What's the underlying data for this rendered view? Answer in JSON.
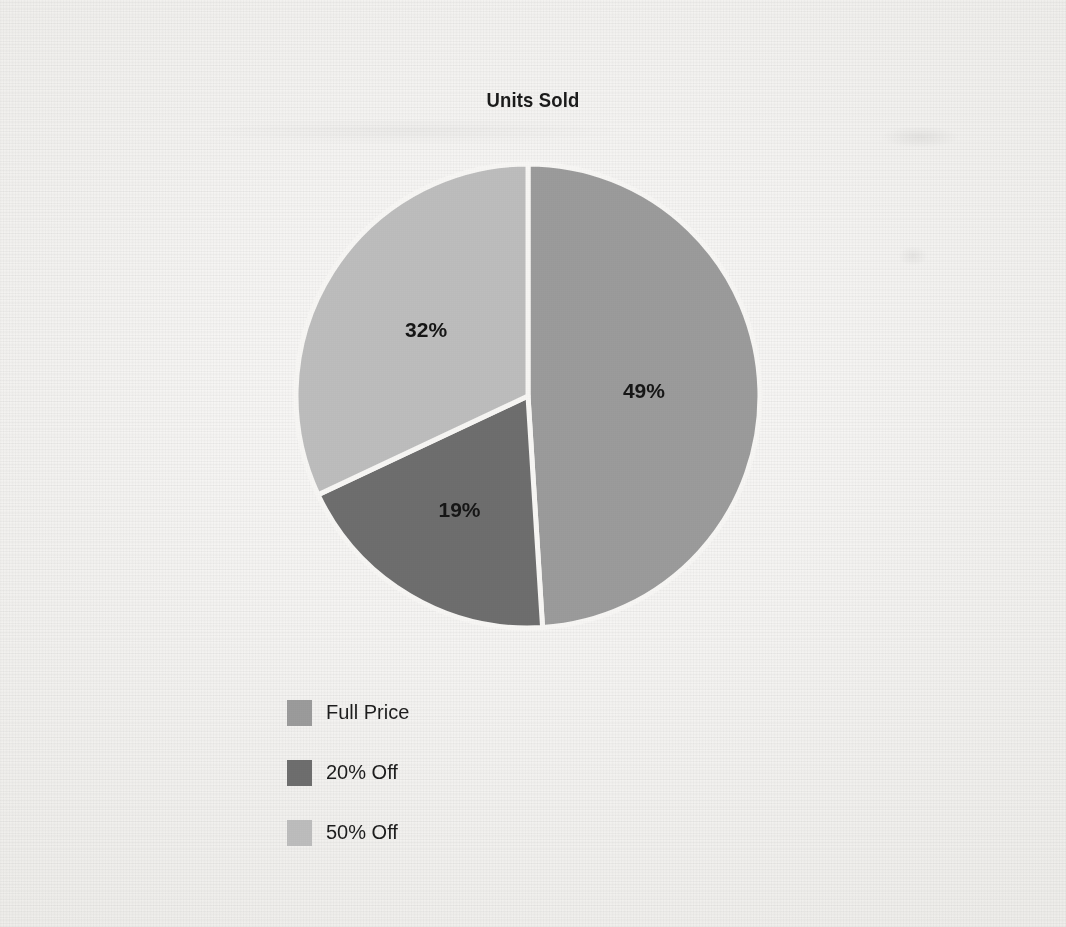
{
  "chart_data": {
    "type": "pie",
    "title": "Units Sold",
    "categories": [
      "Full Price",
      "20% Off",
      "50% Off"
    ],
    "values": [
      49,
      19,
      32
    ],
    "value_labels": [
      "49%",
      "19%",
      "32%"
    ],
    "colors": [
      "#9b9b9b",
      "#6e6e6e",
      "#bdbdbd"
    ],
    "legend_position": "bottom-left",
    "grid": false,
    "start_angle_deg": 0,
    "direction": "clockwise",
    "slice_separator_color": "#f7f6f4",
    "background_color": "#f4f3f1",
    "label_color": "#161616"
  },
  "legend": {
    "items": [
      {
        "label": "Full Price",
        "color": "#9b9b9b"
      },
      {
        "label": "20% Off",
        "color": "#6e6e6e"
      },
      {
        "label": "50% Off",
        "color": "#bdbdbd"
      }
    ]
  },
  "slices": [
    {
      "name": "Full Price",
      "label": "49%",
      "color": "#9b9b9b"
    },
    {
      "name": "20% Off",
      "label": "19%",
      "color": "#6e6e6e"
    },
    {
      "name": "50% Off",
      "label": "32%",
      "color": "#bdbdbd"
    }
  ]
}
